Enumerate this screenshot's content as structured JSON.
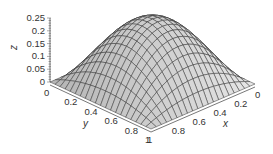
{
  "chart_data": {
    "type": "surface",
    "title": "",
    "function": "z = 4*x*(1-x)*y*(1-y)",
    "xlabel": "x",
    "ylabel": "y",
    "zlabel": "z",
    "xlim": [
      0,
      1
    ],
    "ylim": [
      0,
      1
    ],
    "zlim": [
      0,
      0.25
    ],
    "x_ticks": [
      "0",
      "0.2",
      "0.4",
      "0.6",
      "0.8",
      "1"
    ],
    "y_ticks": [
      "0",
      "0.2",
      "0.4",
      "0.6",
      "0.8",
      "1"
    ],
    "z_ticks": [
      "0",
      "0.05",
      "0.1",
      "0.15",
      "0.2",
      "0.25"
    ],
    "grid_resolution": 20,
    "peak": {
      "x": 0.5,
      "y": 0.5,
      "z": 0.25
    },
    "surface_color": "#c8c8c8",
    "mesh_color": "#333333"
  }
}
